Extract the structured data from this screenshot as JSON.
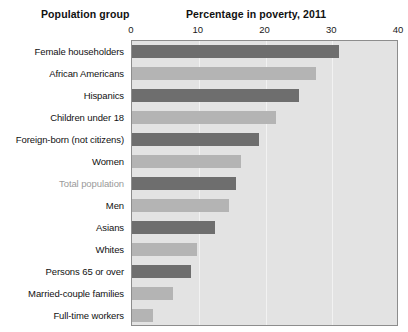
{
  "headers": {
    "group_header": "Population group",
    "metric_header": "Percentage in poverty, 2011"
  },
  "colors": {
    "bar_dark": "#6e6e6e",
    "bar_light": "#b4b4b4",
    "plot_background": "#e3e3e3",
    "plot_border": "#8d8d8d",
    "gridline": "#f2f2f2",
    "label_text": "#111111",
    "label_highlight": "#9a9a9a"
  },
  "chart_data": {
    "type": "bar",
    "orientation": "horizontal",
    "title": "Percentage in poverty, 2011",
    "xlabel": "Percentage in poverty, 2011",
    "ylabel": "Population group",
    "xlim": [
      0,
      40
    ],
    "ylim": null,
    "grid": true,
    "gridlines": [
      10,
      20,
      30
    ],
    "legend": null,
    "tick_labels": [
      "0",
      "10",
      "20",
      "30",
      "40"
    ],
    "ticks": [
      0,
      10,
      20,
      30,
      40
    ],
    "categories": [
      "Female householders",
      "African Americans",
      "Hispanics",
      "Children under 18",
      "Foreign-born (not citizens)",
      "Women",
      "Total population",
      "Men",
      "Asians",
      "Whites",
      "Persons 65 or over",
      "Married-couple families",
      "Full-time workers"
    ],
    "values": [
      31.0,
      27.6,
      25.0,
      21.6,
      19.0,
      16.3,
      15.6,
      14.5,
      12.4,
      9.7,
      8.8,
      6.2,
      3.1
    ],
    "bar_shades": [
      "dark",
      "light",
      "dark",
      "light",
      "dark",
      "light",
      "dark",
      "light",
      "dark",
      "light",
      "dark",
      "light",
      "light"
    ],
    "highlighted_category": "Total population"
  }
}
